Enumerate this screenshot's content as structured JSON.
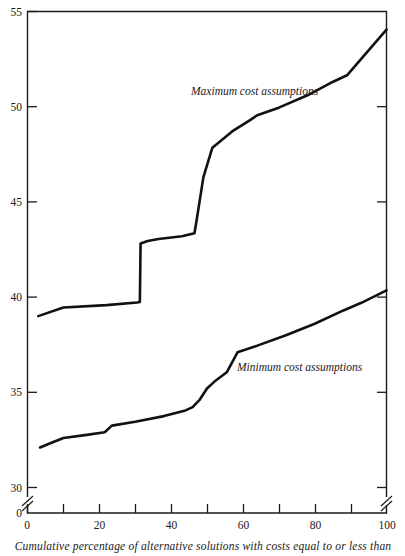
{
  "chart_data": {
    "type": "line",
    "title": "",
    "subtitle": "",
    "xlabel": "Cumulative percentage of alternative solutions with costs equal to or less than",
    "ylabel": "",
    "xlim": [
      0,
      100
    ],
    "ylim": [
      30,
      55
    ],
    "y_axis_break": true,
    "y_break_note": "axis broken between 0 and 30",
    "grid": false,
    "legend_position": "inline-annotations",
    "x_ticks_major": [
      0,
      20,
      40,
      60,
      80,
      100
    ],
    "x_ticks_minor": [
      10,
      30,
      50,
      70,
      90
    ],
    "x_tick_labels": [
      "0",
      "20",
      "40",
      "60",
      "80",
      "100"
    ],
    "y_ticks": [
      30,
      35,
      40,
      45,
      50,
      55
    ],
    "y_tick_labels": [
      "30",
      "35",
      "40",
      "45",
      "50",
      "55"
    ],
    "y_zero_label": "0",
    "series": [
      {
        "name": "Maximum cost assumptions",
        "label_x": 49,
        "label_y": 51.1,
        "points": [
          [
            3.0,
            39.0
          ],
          [
            10.0,
            39.45
          ],
          [
            22.0,
            39.58
          ],
          [
            30.5,
            39.72
          ],
          [
            31.3,
            39.75
          ],
          [
            31.5,
            42.82
          ],
          [
            33.5,
            42.95
          ],
          [
            36.5,
            43.05
          ],
          [
            43.0,
            43.2
          ],
          [
            46.5,
            43.35
          ],
          [
            47.0,
            43.9
          ],
          [
            49.0,
            46.3
          ],
          [
            51.5,
            47.85
          ],
          [
            57.0,
            48.7
          ],
          [
            62.0,
            49.3
          ],
          [
            64.0,
            49.55
          ],
          [
            70.0,
            49.95
          ],
          [
            78.0,
            50.6
          ],
          [
            85.0,
            51.3
          ],
          [
            89.0,
            51.65
          ],
          [
            92.0,
            52.3
          ],
          [
            100.0,
            54.05
          ]
        ]
      },
      {
        "name": "Minimum cost assumptions",
        "label_x": 60,
        "label_y": 36.6,
        "points": [
          [
            3.5,
            32.1
          ],
          [
            6.0,
            32.3
          ],
          [
            10.0,
            32.6
          ],
          [
            16.0,
            32.75
          ],
          [
            21.5,
            32.9
          ],
          [
            23.5,
            33.25
          ],
          [
            30.0,
            33.45
          ],
          [
            38.0,
            33.75
          ],
          [
            44.0,
            34.05
          ],
          [
            46.0,
            34.22
          ],
          [
            48.0,
            34.62
          ],
          [
            50.0,
            35.2
          ],
          [
            52.0,
            35.55
          ],
          [
            55.5,
            36.05
          ],
          [
            58.5,
            37.1
          ],
          [
            64.0,
            37.45
          ],
          [
            72.0,
            38.0
          ],
          [
            80.0,
            38.6
          ],
          [
            88.0,
            39.3
          ],
          [
            93.0,
            39.7
          ],
          [
            100.0,
            40.35
          ]
        ]
      }
    ]
  }
}
